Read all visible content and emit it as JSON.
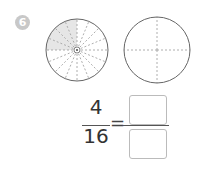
{
  "problem": {
    "number": "6",
    "badge_color": "#c8c8c8"
  },
  "left_circle": {
    "total_parts": 16,
    "shaded_parts": 4,
    "shade_color": "#e6e6e6",
    "shaded_region": "upper-left quarter"
  },
  "right_circle": {
    "total_parts": 4,
    "shaded_parts": 0
  },
  "equation": {
    "numerator": "4",
    "denominator": "16",
    "equals": "=",
    "answer_numerator": "",
    "answer_denominator": ""
  }
}
